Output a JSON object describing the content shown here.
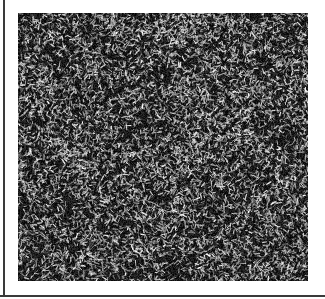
{
  "figure": {
    "type": "grayscale-texture",
    "colors": {
      "background": "#ffffff",
      "border": "#3a3a3a",
      "dark": "#1a1a1a",
      "light": "#f0f0f0"
    },
    "panel": {
      "x": 18,
      "y": 13,
      "width": 290,
      "height": 268
    }
  }
}
